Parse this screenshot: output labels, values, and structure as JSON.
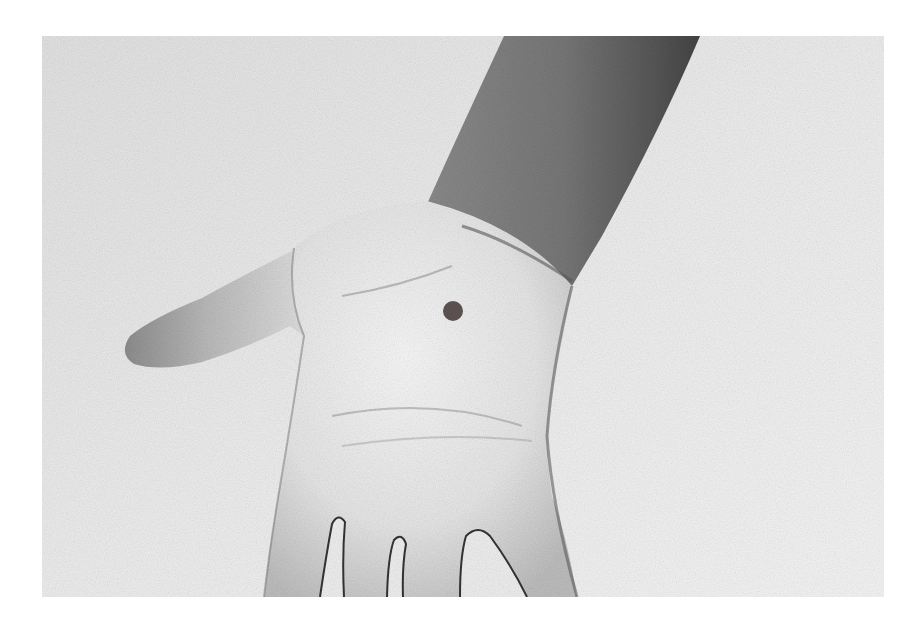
{
  "image": {
    "description": "Grayscale photograph of an open left palm facing up with thumb extended, with a single dot marker on the center of the palm",
    "subject": "open-palm-hand",
    "style": "grayscale",
    "marker": {
      "shape": "circle",
      "color": "#5a5050",
      "center_x": 453,
      "center_y": 311,
      "radius": 10
    },
    "colors": {
      "page_background": "#ffffff",
      "backdrop": "#ececec",
      "skin_light": "#f4f4f4",
      "skin_mid": "#cfcfcf",
      "forearm_dark": "#6e6e6e",
      "shadow": "#3a3a3a"
    }
  }
}
